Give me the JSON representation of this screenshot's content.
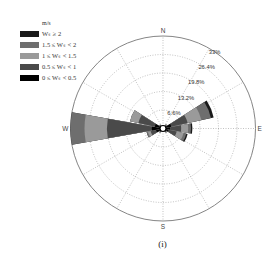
{
  "chart_data": {
    "type": "windrose",
    "unit": "m/s",
    "legend": [
      {
        "label": "W_s ≥ 2",
        "display": "Wₛ ≥ 2",
        "color": "#1a1a1a"
      },
      {
        "label": "1.5 ≤ W_s < 2",
        "display": "1.5 ≤ Wₛ < 2",
        "color": "#6e6e6e"
      },
      {
        "label": "1 ≤ W_s < 1.5",
        "display": "1 ≤ Wₛ < 1.5",
        "color": "#9a9a9a"
      },
      {
        "label": "0.5 ≤ W_s < 1",
        "display": "0.5 ≤ Wₛ < 1",
        "color": "#4a4a4a"
      },
      {
        "label": "0 ≤ W_s < 0.5",
        "display": "0 ≤ Wₛ < 0.5",
        "color": "#000000"
      }
    ],
    "directions": [
      "N",
      "NNE",
      "NE",
      "ENE",
      "E",
      "ESE",
      "SE",
      "SSE",
      "S",
      "SSW",
      "SW",
      "WSW",
      "W",
      "WNW",
      "NW",
      "NNW"
    ],
    "bins_order": [
      "0 ≤ W_s < 0.5",
      "0.5 ≤ W_s < 1",
      "1 ≤ W_s < 1.5",
      "1.5 ≤ W_s < 2",
      "W_s ≥ 2"
    ],
    "series": [
      {
        "name": "0 ≤ W_s < 0.5",
        "values": [
          0.5,
          0.5,
          1.0,
          3.0,
          2.5,
          2.0,
          1.0,
          0.5,
          0.5,
          0.5,
          1.0,
          2.5,
          4.0,
          3.0,
          1.0,
          0.5
        ]
      },
      {
        "name": "0.5 ≤ W_s < 1",
        "values": [
          0.3,
          0.3,
          0.5,
          6.0,
          4.0,
          3.0,
          0.5,
          0.3,
          0.2,
          0.3,
          0.5,
          2.0,
          16.0,
          6.0,
          0.5,
          0.3
        ]
      },
      {
        "name": "1 ≤ W_s < 1.5",
        "values": [
          0.2,
          0.2,
          0.3,
          5.0,
          2.5,
          2.5,
          0.3,
          0.2,
          0.1,
          0.2,
          0.3,
          1.0,
          8.0,
          3.0,
          0.2,
          0.2
        ]
      },
      {
        "name": "1.5 ≤ W_s < 2",
        "values": [
          0,
          0,
          0,
          3.5,
          1.0,
          1.0,
          0,
          0,
          0,
          0,
          0,
          0.5,
          5.0,
          0,
          0,
          0
        ]
      },
      {
        "name": "W_s ≥ 2",
        "values": [
          0,
          0,
          0,
          1.0,
          0.5,
          0.5,
          0,
          0,
          0,
          0,
          0,
          0,
          0,
          0,
          0,
          0
        ]
      }
    ],
    "radial_ticks": [
      6.6,
      13.2,
      19.8,
      26.4,
      33
    ],
    "radial_tick_labels": [
      "6.6%",
      "13.2%",
      "19.8%",
      "26.4%",
      "33%"
    ],
    "rmax": 33,
    "compass_labels": {
      "N": "N",
      "E": "E",
      "S": "S",
      "W": "W"
    },
    "grid": true,
    "legend_position": "upper-left",
    "caption": "(i)"
  },
  "legend": {
    "unit": "m/s",
    "items": [
      "Wₛ ≥ 2",
      "1.5 ≤ Wₛ < 2",
      "1 ≤ Wₛ < 1.5",
      "0.5 ≤ Wₛ < 1",
      "0 ≤ Wₛ < 0.5"
    ]
  },
  "caption": "(i)"
}
